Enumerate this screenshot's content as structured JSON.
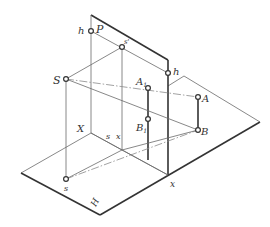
{
  "figure": {
    "colors": {
      "line": "#333333",
      "thin_line": "#6a6a6a",
      "background": "#ffffff"
    }
  },
  "labels": {
    "h_left": "h",
    "P": "P",
    "s_prime": "s'",
    "S": "S",
    "h_right": "h",
    "A1": "A",
    "A1_sub": "1",
    "A": "A",
    "B1": "B",
    "B1_sub": "1",
    "B": "B",
    "X": "X",
    "s_ground": "s",
    "x_ground": "x",
    "s_bottom": "s",
    "x_bottom": "x",
    "H": "H"
  },
  "points": {
    "h_left": [
      91,
      31
    ],
    "s_prime": [
      122,
      47
    ],
    "S": [
      66,
      79
    ],
    "h_right": [
      168,
      73
    ],
    "A1": [
      148,
      88
    ],
    "A": [
      198,
      97
    ],
    "B1": [
      148,
      119
    ],
    "B": [
      198,
      130
    ],
    "s": [
      66,
      179
    ],
    "x": [
      168,
      175
    ]
  }
}
